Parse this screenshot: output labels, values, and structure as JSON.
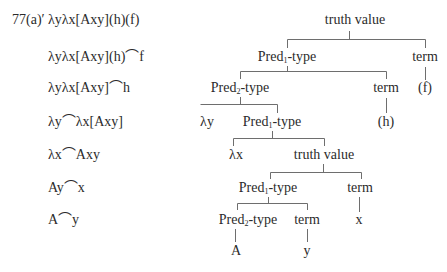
{
  "example": {
    "number": "77(a)′",
    "derivation_steps": [
      "λyλx[Axy](h)(f)",
      "λyλx[Axy](h)⌒f",
      "λyλx[Axy]⌒h",
      "λy⌒λx[Axy]",
      "λx⌒Axy",
      "Ay⌒x",
      "A⌒y"
    ]
  },
  "tree": {
    "root": "truth value",
    "n_pred1_a": {
      "pre": "Pred",
      "sub": "1",
      "post": "-type"
    },
    "n_term_f": "term",
    "leaf_f": "(f)",
    "n_pred2_a": {
      "pre": "Pred",
      "sub": "2",
      "post": "-type"
    },
    "n_term_h": "term",
    "leaf_h": "(h)",
    "n_lambda_y": "λy",
    "n_pred1_b": {
      "pre": "Pred",
      "sub": "1",
      "post": "-type"
    },
    "n_lambda_x": "λx",
    "n_truth_value_b": "truth value",
    "n_pred1_c": {
      "pre": "Pred",
      "sub": "1",
      "post": "-type"
    },
    "n_term_x": "term",
    "leaf_x": "x",
    "n_pred2_b": {
      "pre": "Pred",
      "sub": "2",
      "post": "-type"
    },
    "n_term_y": "term",
    "leaf_A": "A",
    "leaf_y": "y"
  }
}
